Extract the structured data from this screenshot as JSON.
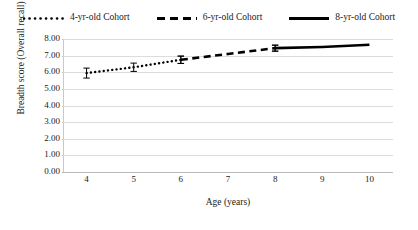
{
  "chart_data": {
    "type": "line",
    "title": "",
    "xlabel": "Age (years)",
    "ylabel": "Breadth score (Overall recall)",
    "x": [
      4,
      5,
      6,
      7,
      8,
      9,
      10
    ],
    "xlim": [
      3.5,
      10.5
    ],
    "ylim": [
      0.0,
      8.0
    ],
    "ytick_labels": [
      "8.00",
      "7.00",
      "6.00",
      "5.00",
      "4.00",
      "3.00",
      "2.00",
      "1.00",
      "0.00"
    ],
    "ytick_values": [
      8.0,
      7.0,
      6.0,
      5.0,
      4.0,
      3.0,
      2.0,
      1.0,
      0.0
    ],
    "xtick_labels": [
      "4",
      "5",
      "6",
      "7",
      "8",
      "9",
      "10"
    ],
    "grid": "horizontal",
    "legend_position": "top-center",
    "series": [
      {
        "name": "4-yr-old Cohort",
        "style": "dotted",
        "color": "#000000",
        "x": [
          4,
          5,
          6
        ],
        "values": [
          5.95,
          6.3,
          6.75
        ],
        "errors": [
          0.3,
          0.25,
          0.22
        ]
      },
      {
        "name": "6-yr-old Cohort",
        "style": "dashed",
        "color": "#000000",
        "x": [
          6,
          7,
          8
        ],
        "values": [
          6.75,
          7.1,
          7.45
        ],
        "errors": [
          0.22,
          0.0,
          0.18
        ]
      },
      {
        "name": "8-yr-old Cohort",
        "style": "solid",
        "color": "#000000",
        "x": [
          8,
          9,
          10
        ],
        "values": [
          7.45,
          7.52,
          7.65
        ],
        "errors": [
          0.18,
          0.0,
          0.0
        ]
      }
    ]
  },
  "legend": {
    "entries": [
      {
        "label": "4-yr-old Cohort",
        "style": "dotted"
      },
      {
        "label": "6-yr-old Cohort",
        "style": "dashed"
      },
      {
        "label": "8-yr-old Cohort",
        "style": "solid"
      }
    ]
  },
  "axes": {
    "y_title": "Breadth score (Overall recall)",
    "x_title": "Age (years)"
  },
  "colors": {
    "series": "#000000",
    "grid": "#dcdcdc",
    "axis": "#b9b9b9",
    "text": "#222222",
    "background": "#ffffff"
  }
}
